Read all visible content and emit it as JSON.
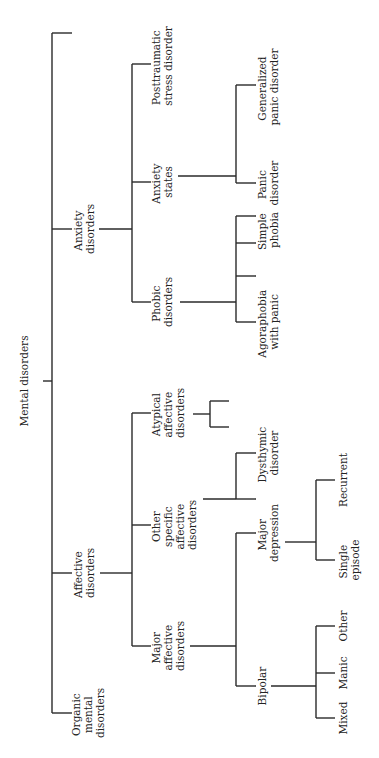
{
  "diagram": {
    "type": "tree",
    "orientation": "rotated-90-ccw",
    "root": "Mental disorders",
    "nodes": {
      "root": [
        "Mental disorders"
      ],
      "organic": [
        "Organic",
        "mental",
        "disorders"
      ],
      "affective": [
        "Affective",
        "disorders"
      ],
      "anxiety": [
        "Anxiety",
        "disorders"
      ],
      "major_affective": [
        "Major",
        "affective",
        "disorders"
      ],
      "other_specific": [
        "Other",
        "specific",
        "affective",
        "disorders"
      ],
      "atypical": [
        "Atypical",
        "affective",
        "disorders"
      ],
      "phobic": [
        "Phobic",
        "disorders"
      ],
      "anxiety_states": [
        "Anxiety",
        "states"
      ],
      "ptsd": [
        "Posttraumatic",
        "stress disorder"
      ],
      "bipolar": [
        "Bipolar"
      ],
      "major_depression": [
        "Major",
        "depression"
      ],
      "dysthymic": [
        "Dysthymic",
        "disorder"
      ],
      "agoraphobia": [
        "Agoraphobia",
        "with panic"
      ],
      "simple_phobia": [
        "Simple",
        "phobia"
      ],
      "panic": [
        "Panic",
        "disorder"
      ],
      "generalized": [
        "Generalized",
        "panic disorder"
      ],
      "mixed": [
        "Mixed"
      ],
      "manic": [
        "Manic"
      ],
      "other": [
        "Other"
      ],
      "single": [
        "Single",
        "episode"
      ],
      "recurrent": [
        "Recurrent"
      ]
    },
    "edges": [
      [
        "Mental disorders",
        "Organic mental disorders"
      ],
      [
        "Mental disorders",
        "Affective disorders"
      ],
      [
        "Mental disorders",
        "Anxiety disorders"
      ],
      [
        "Mental disorders",
        "(unlabeled branch)"
      ],
      [
        "Affective disorders",
        "Major affective disorders"
      ],
      [
        "Affective disorders",
        "Other specific affective disorders"
      ],
      [
        "Affective disorders",
        "Atypical affective disorders"
      ],
      [
        "Anxiety disorders",
        "Phobic disorders"
      ],
      [
        "Anxiety disorders",
        "Anxiety states"
      ],
      [
        "Anxiety disorders",
        "Posttraumatic stress disorder"
      ],
      [
        "Major affective disorders",
        "Bipolar"
      ],
      [
        "Major affective disorders",
        "Major depression"
      ],
      [
        "Other specific affective disorders",
        "Dysthymic disorder"
      ],
      [
        "Phobic disorders",
        "Agoraphobia with panic"
      ],
      [
        "Phobic disorders",
        "Simple phobia"
      ],
      [
        "Anxiety states",
        "Panic disorder"
      ],
      [
        "Anxiety states",
        "Generalized panic disorder"
      ],
      [
        "Bipolar",
        "Mixed"
      ],
      [
        "Bipolar",
        "Manic"
      ],
      [
        "Bipolar",
        "Other"
      ],
      [
        "Major depression",
        "Single episode"
      ],
      [
        "Major depression",
        "Recurrent"
      ]
    ]
  }
}
